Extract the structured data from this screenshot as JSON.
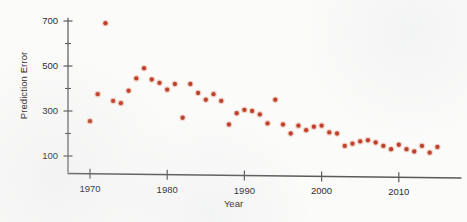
{
  "chart_data": {
    "type": "scatter",
    "title": "",
    "xlabel": "Year",
    "ylabel": "Prediction Error",
    "xlim": [
      1968,
      2017
    ],
    "ylim": [
      0,
      760
    ],
    "grid": false,
    "legend": null,
    "marker_color": "#c0412a",
    "axis_color": "#5a5a5a",
    "xticks": [
      1970,
      1980,
      1990,
      2000,
      2010
    ],
    "xtick_labels": [
      "1970",
      "1980",
      "1990",
      "2000",
      "2010"
    ],
    "yticks": [
      100,
      300,
      500,
      700
    ],
    "ytick_labels": [
      "100",
      "300",
      "500",
      "700"
    ],
    "yticks_minor": [
      200,
      400,
      600
    ],
    "x": [
      1970,
      1971,
      1972,
      1973,
      1974,
      1975,
      1976,
      1977,
      1978,
      1979,
      1980,
      1981,
      1982,
      1983,
      1984,
      1985,
      1986,
      1987,
      1988,
      1989,
      1990,
      1991,
      1992,
      1993,
      1994,
      1995,
      1996,
      1997,
      1998,
      1999,
      2000,
      2001,
      2002,
      2003,
      2004,
      2005,
      2006,
      2007,
      2008,
      2009,
      2010,
      2011,
      2012,
      2013,
      2014,
      2015
    ],
    "y": [
      255,
      375,
      690,
      345,
      335,
      390,
      445,
      490,
      440,
      425,
      395,
      420,
      270,
      420,
      380,
      350,
      375,
      345,
      240,
      290,
      305,
      300,
      285,
      245,
      350,
      240,
      200,
      235,
      215,
      230,
      235,
      205,
      200,
      145,
      155,
      165,
      170,
      160,
      145,
      130,
      150,
      130,
      120,
      145,
      115,
      140
    ],
    "points": [
      {
        "year": 1970,
        "value": 255
      },
      {
        "year": 1971,
        "value": 375
      },
      {
        "year": 1972,
        "value": 690
      },
      {
        "year": 1973,
        "value": 345
      },
      {
        "year": 1974,
        "value": 335
      },
      {
        "year": 1975,
        "value": 390
      },
      {
        "year": 1976,
        "value": 445
      },
      {
        "year": 1977,
        "value": 490
      },
      {
        "year": 1978,
        "value": 440
      },
      {
        "year": 1979,
        "value": 425
      },
      {
        "year": 1980,
        "value": 395
      },
      {
        "year": 1981,
        "value": 420
      },
      {
        "year": 1982,
        "value": 270
      },
      {
        "year": 1983,
        "value": 420
      },
      {
        "year": 1984,
        "value": 380
      },
      {
        "year": 1985,
        "value": 350
      },
      {
        "year": 1986,
        "value": 375
      },
      {
        "year": 1987,
        "value": 345
      },
      {
        "year": 1988,
        "value": 240
      },
      {
        "year": 1989,
        "value": 290
      },
      {
        "year": 1990,
        "value": 305
      },
      {
        "year": 1991,
        "value": 300
      },
      {
        "year": 1992,
        "value": 285
      },
      {
        "year": 1993,
        "value": 245
      },
      {
        "year": 1994,
        "value": 350
      },
      {
        "year": 1995,
        "value": 240
      },
      {
        "year": 1996,
        "value": 200
      },
      {
        "year": 1997,
        "value": 235
      },
      {
        "year": 1998,
        "value": 215
      },
      {
        "year": 1999,
        "value": 230
      },
      {
        "year": 2000,
        "value": 235
      },
      {
        "year": 2001,
        "value": 205
      },
      {
        "year": 2002,
        "value": 200
      },
      {
        "year": 2003,
        "value": 145
      },
      {
        "year": 2004,
        "value": 155
      },
      {
        "year": 2005,
        "value": 165
      },
      {
        "year": 2006,
        "value": 170
      },
      {
        "year": 2007,
        "value": 160
      },
      {
        "year": 2008,
        "value": 145
      },
      {
        "year": 2009,
        "value": 130
      },
      {
        "year": 2010,
        "value": 150
      },
      {
        "year": 2011,
        "value": 130
      },
      {
        "year": 2012,
        "value": 120
      },
      {
        "year": 2013,
        "value": 145
      },
      {
        "year": 2014,
        "value": 115
      },
      {
        "year": 2015,
        "value": 140
      }
    ]
  }
}
